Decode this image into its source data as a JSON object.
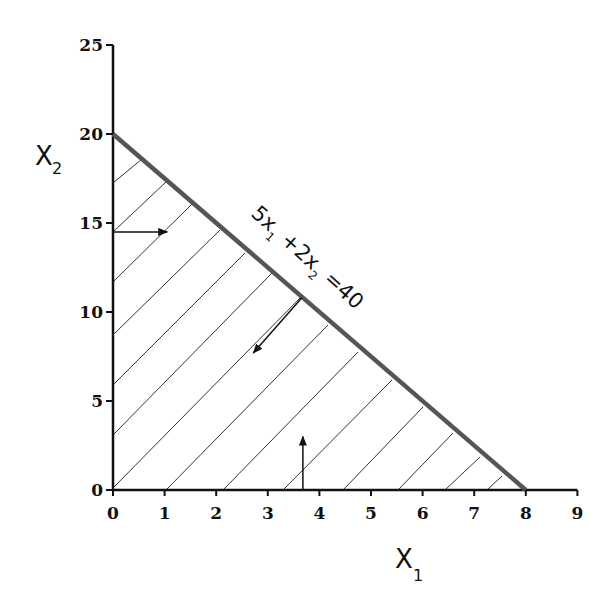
{
  "chart_data": {
    "type": "line",
    "title": "",
    "subtitle": "",
    "xlabel": "X",
    "xlabel_subscript": "1",
    "ylabel": "X",
    "ylabel_subscript": "2",
    "xlim": [
      0,
      9
    ],
    "ylim": [
      0,
      25
    ],
    "x_ticks": [
      0,
      1,
      2,
      3,
      4,
      5,
      6,
      7,
      8,
      9
    ],
    "y_ticks": [
      0,
      5,
      10,
      15,
      20,
      25
    ],
    "grid": false,
    "legend": null,
    "series": [
      {
        "name": "5x1 + 2x2 = 40",
        "x": [
          0,
          8
        ],
        "y": [
          20,
          0
        ],
        "color": "#555555"
      }
    ],
    "feasible_region": {
      "vertices": [
        [
          0,
          0
        ],
        [
          0,
          20
        ],
        [
          8,
          0
        ]
      ],
      "fill": "hatched",
      "description": "Region 5x1 + 2x2 <= 40, x1 >= 0, x2 >= 0"
    },
    "annotations": [
      {
        "type": "label",
        "text_parts": [
          "5x",
          "1",
          " +2x",
          "2",
          " =40"
        ],
        "text": "5x1 +2x2 =40",
        "rotation_deg": 42
      },
      {
        "type": "arrow",
        "description": "from x2-axis pointing right (x1 >= 0)",
        "from": [
          0,
          14.5
        ],
        "to": [
          1.05,
          14.5
        ]
      },
      {
        "type": "arrow",
        "description": "from constraint line pointing into feasible region",
        "from": [
          3.66,
          10.8
        ],
        "to": [
          2.72,
          7.7
        ]
      },
      {
        "type": "arrow",
        "description": "from x1-axis pointing up (x2 >= 0)",
        "from": [
          3.68,
          0
        ],
        "to": [
          3.68,
          3.0
        ]
      }
    ]
  },
  "layout": {
    "origin_px": [
      113,
      490
    ],
    "x_unit_px": 51.6,
    "y_unit_px": 17.8,
    "colors": {
      "axis": "#111111",
      "constraint_line": "#555555",
      "hatch": "#333333",
      "arrow": "#111111"
    },
    "hatch_lines_px": [
      [
        [
          113,
          183
        ],
        [
          142,
          159
        ]
      ],
      [
        [
          113,
          232
        ],
        [
          167,
          181
        ]
      ],
      [
        [
          113,
          282
        ],
        [
          193,
          203
        ]
      ],
      [
        [
          113,
          335
        ],
        [
          220,
          230
        ]
      ],
      [
        [
          113,
          385
        ],
        [
          245,
          253
        ]
      ],
      [
        [
          113,
          435
        ],
        [
          272,
          273
        ]
      ],
      [
        [
          113,
          488
        ],
        [
          300,
          298
        ]
      ],
      [
        [
          166,
          490
        ],
        [
          328,
          325
        ]
      ],
      [
        [
          223,
          490
        ],
        [
          358,
          352
        ]
      ],
      [
        [
          283,
          490
        ],
        [
          392,
          380
        ]
      ],
      [
        [
          343,
          490
        ],
        [
          423,
          407
        ]
      ],
      [
        [
          398,
          490
        ],
        [
          453,
          433
        ]
      ],
      [
        [
          445,
          490
        ],
        [
          480,
          457
        ]
      ],
      [
        [
          487,
          490
        ],
        [
          502,
          476
        ]
      ]
    ],
    "label_anchor_px": [
      250,
      215
    ]
  }
}
